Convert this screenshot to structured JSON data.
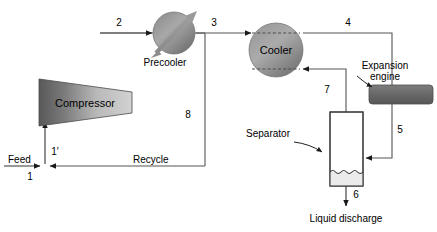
{
  "diagram": {
    "equipment": [
      {
        "id": "compressor",
        "label": "Compressor",
        "shape": "trapezoid",
        "label_position": "inside"
      },
      {
        "id": "precooler",
        "label": "Precooler",
        "shape": "circle-with-arrow",
        "label_position": "below"
      },
      {
        "id": "cooler",
        "label": "Cooler",
        "shape": "circle-dashed",
        "label_position": "inside"
      },
      {
        "id": "expansion-engine",
        "label": "Expansion\nengine",
        "shape": "rounded-rect",
        "label_position": "callout"
      },
      {
        "id": "separator",
        "label": "Separator",
        "shape": "vertical-vessel",
        "label_position": "callout"
      }
    ],
    "equipment_labels": {
      "compressor": "Compressor",
      "precooler": "Precooler",
      "cooler": "Cooler",
      "expansion_engine_line1": "Expansion",
      "expansion_engine_line2": "engine",
      "separator": "Separator"
    },
    "stream_labels": {
      "feed": "Feed",
      "recycle": "Recycle",
      "liquid_discharge": "Liquid discharge"
    },
    "stream_numbers": {
      "s1": "1",
      "s1prime": "1′",
      "s2": "2",
      "s3": "3",
      "s4": "4",
      "s5": "5",
      "s6": "6",
      "s7": "7",
      "s8": "8"
    },
    "colors": {
      "background": "#ffffff",
      "line": "#555555",
      "equipment_dark": "#6f6f6f",
      "equipment_light": "#d8d8d8",
      "liquid_fill": "#e6e6e6",
      "text": "#000000"
    }
  }
}
